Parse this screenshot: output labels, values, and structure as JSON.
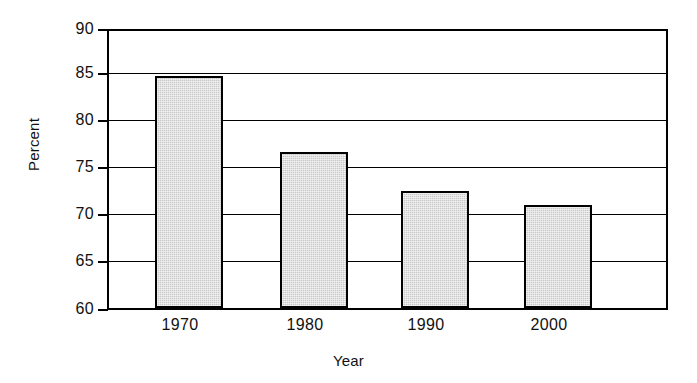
{
  "chart_data": {
    "type": "bar",
    "title": "",
    "xlabel": "Year",
    "ylabel": "Percent",
    "categories": [
      "1970",
      "1980",
      "1990",
      "2000"
    ],
    "values": [
      85.1,
      76.9,
      72.7,
      71.2
    ],
    "series": [
      {
        "name": "Percent",
        "values": [
          85.1,
          76.9,
          72.7,
          71.2
        ]
      }
    ],
    "ylim": [
      60,
      90
    ],
    "ytick_labels": [
      "90",
      "85",
      "80",
      "75",
      "70",
      "65",
      "60"
    ],
    "ytick_values": [
      90,
      85,
      80,
      75,
      70,
      65,
      60
    ],
    "grid": "horizontal",
    "legend": "none",
    "bar_fill_color": "#c9c9c9",
    "bar_edge_color": "#000000",
    "frame_color": "#000000",
    "background_color": "#ffffff"
  },
  "axes": {
    "y_title": "Percent",
    "x_title": "Year"
  }
}
